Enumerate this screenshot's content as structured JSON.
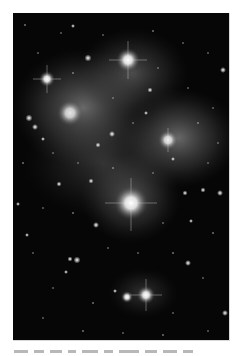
{
  "image": {
    "subject": "Pleiades star cluster (M45) with reflection nebulosity",
    "style": "grayscale astronomical photograph",
    "colors": {
      "background": "#050505",
      "nebula": "#6a6a6a",
      "star": "#ffffff",
      "page": "#ffffff"
    },
    "bright_stars": [
      {
        "name": "star-top-center",
        "x": 115,
        "y": 47,
        "r": 7
      },
      {
        "name": "star-upper-left",
        "x": 34,
        "y": 66,
        "r": 5
      },
      {
        "name": "star-left-nebula",
        "x": 57,
        "y": 100,
        "r": 8
      },
      {
        "name": "star-right-nebula",
        "x": 155,
        "y": 127,
        "r": 6
      },
      {
        "name": "star-center-large",
        "x": 118,
        "y": 190,
        "r": 10
      },
      {
        "name": "star-bottom-pair-right",
        "x": 133,
        "y": 282,
        "r": 6
      },
      {
        "name": "star-bottom-pair-left",
        "x": 114,
        "y": 284,
        "r": 4
      }
    ]
  },
  "caption": {
    "text": ""
  }
}
